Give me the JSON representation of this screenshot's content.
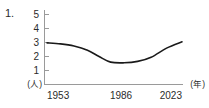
{
  "item_number": "1.",
  "chart_data": {
    "type": "line",
    "title": "",
    "subtitle": "",
    "xlabel": "(年)",
    "ylabel": "(人)",
    "xlim": [
      1953,
      2023
    ],
    "ylim": [
      0,
      5
    ],
    "grid": false,
    "legend": null,
    "y_ticks": [
      "5",
      "4",
      "3",
      "2",
      "1"
    ],
    "y_tick_values": [
      5,
      4,
      3,
      2,
      1
    ],
    "x_ticks": [
      "1953",
      "1986",
      "2023"
    ],
    "x_tick_values": [
      1953,
      1986,
      2023
    ],
    "series": [
      {
        "name": "世帯人員",
        "color": "#1a1a1a",
        "x": [
          1953,
          1960,
          1967,
          1974,
          1980,
          1986,
          1993,
          2000,
          2007,
          2015,
          2023
        ],
        "values": [
          2.97,
          2.9,
          2.75,
          2.45,
          2.0,
          1.6,
          1.55,
          1.65,
          1.95,
          2.6,
          3.05
        ]
      }
    ],
    "annotations": []
  },
  "axis_labels": {
    "y_unit": "(人)",
    "x_unit": "(年)",
    "y_5": "5",
    "y_4": "4",
    "y_3": "3",
    "y_2": "2",
    "y_1": "1",
    "x_start": "1953",
    "x_mid": "1986",
    "x_end": "2023"
  },
  "colors": {
    "line": "#1a1a1a",
    "axis": "#9a9a9a",
    "text": "#2b2b2b",
    "background": "#ffffff"
  }
}
